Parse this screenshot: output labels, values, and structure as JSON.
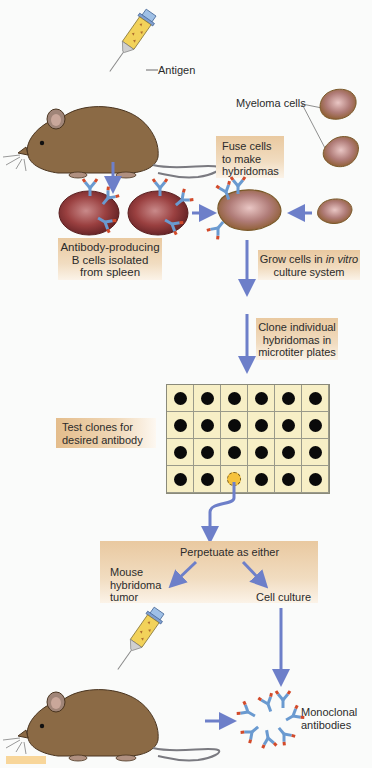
{
  "figure": {
    "caption_fragment_visible": "Figure"
  },
  "labels": {
    "antigen": "Antigen",
    "myeloma_cells": "Myeloma cells",
    "fuse_cells": [
      "Fuse cells",
      "to make",
      "hybridomas"
    ],
    "b_cells": [
      "Antibody-producing",
      "B cells isolated",
      "from spleen"
    ],
    "grow_cells_prefix": "Grow cells in ",
    "grow_cells_italic": "in vitro",
    "grow_cells_line2": "culture system",
    "clone": [
      "Clone individual",
      "hybridomas in",
      "microtiter plates"
    ],
    "test_clones": [
      "Test clones for",
      "desired antibody"
    ],
    "perpetuate": "Perpetuate as either",
    "mouse_tumor": [
      "Mouse",
      "hybridoma",
      "tumor"
    ],
    "cell_culture": "Cell culture",
    "monoclonal": [
      "Monoclonal",
      "antibodies"
    ]
  },
  "microtiter_plate": {
    "rows": 4,
    "cols": 6,
    "selected_well": {
      "row": 4,
      "col": 3
    }
  },
  "colors": {
    "arrow": "#6d7fc9",
    "label_box": "#ecc9a0",
    "well_fill": "#f7efc6",
    "well_dot": "#0a0a0a",
    "selected_well": "#f5c23c",
    "mouse": "#8b6a45",
    "cell": "#8a3a3a",
    "antibody_blue": "#6a9ad0",
    "antibody_red": "#d24a2a"
  }
}
